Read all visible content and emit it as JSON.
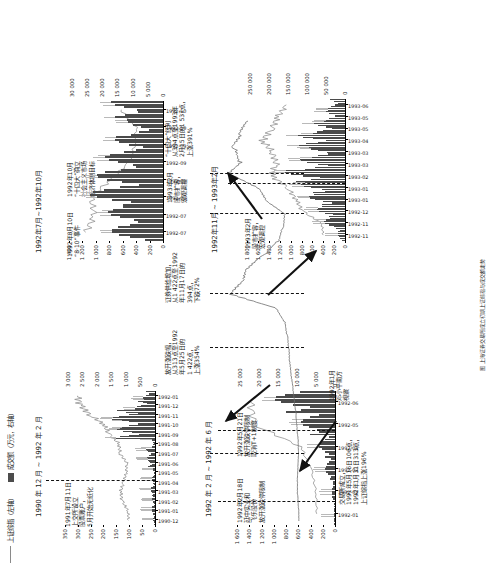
{
  "figure": {
    "caption": "图  上海证券交易所成立初期上证综指与成交额走势",
    "legend": [
      {
        "key": "index",
        "label": "上证综指（左轴）",
        "style": "line",
        "color": "#8a8a8a"
      },
      {
        "key": "volume",
        "label": "成交额（万元，右轴）",
        "style": "bar",
        "color": "#4c4c4c"
      }
    ]
  },
  "panels": [
    {
      "id": "panel-1990-1992",
      "title": "1990 年 12 月 ~ 1992 年 2 月",
      "annotations": [
        {
          "id": "a1",
          "text": "1991年7月11日\n上交所设立\n股票账户，\n5月开始无纸化"
        }
      ],
      "chart_data": {
        "type": "bar",
        "title": "1990 年 12 月 ~ 1992 年 2 月",
        "ylabel": "上证综指（左轴）",
        "y2label": "成交额（万元，右轴）",
        "ylim": [
          0,
          350
        ],
        "yticks": [
          0,
          50,
          100,
          150,
          200,
          250,
          300,
          350
        ],
        "y2lim": [
          0,
          3000
        ],
        "y2ticks": [
          0,
          500,
          1000,
          1500,
          2000,
          2500,
          3000
        ],
        "categories": [
          "1990-12",
          "1991-01",
          "1991-02",
          "1991-03",
          "1991-04",
          "1991-05",
          "1991-06",
          "1991-07",
          "1991-08",
          "1991-09",
          "1991-10",
          "1991-11",
          "1991-12",
          "1992-01"
        ],
        "series": [
          {
            "name": "上证综指",
            "type": "line",
            "values": [
              103,
              105,
              128,
              133,
              121,
              111,
              110,
              136,
              140,
              180,
              198,
              252,
              290,
              300
            ]
          },
          {
            "name": "成交额",
            "type": "bar",
            "values": [
              60,
              120,
              90,
              150,
              110,
              70,
              260,
              300,
              120,
              1350,
              1200,
              1500,
              700,
              420
            ]
          }
        ],
        "grid": false,
        "legend_position": "top"
      }
    },
    {
      "id": "panel-1992-02-06",
      "title": "1992 年 2 月 ~ 1992 年 6 月",
      "annotations": [
        {
          "id": "a2",
          "text": "1992年2月18日\n延中实业和\n飞乐股份\n放开涨跌停限制"
        },
        {
          "id": "a3",
          "text": "1992年5月21日\n放开涨跌停限制\n取消T+1制度"
        }
      ],
      "chart_data": {
        "type": "bar",
        "title": "1992 年 2 月 ~ 1992 年 6 月",
        "ylabel": "上证综指（左轴）",
        "y2label": "成交额（万元，右轴）",
        "ylim": [
          0,
          1600
        ],
        "yticks": [
          0,
          200,
          400,
          600,
          800,
          1000,
          1200,
          1400,
          1600
        ],
        "y2lim": [
          0,
          25000
        ],
        "y2ticks": [
          0,
          5000,
          10000,
          15000,
          20000,
          25000
        ],
        "categories": [
          "1992-01",
          "1992-02",
          "1992-03",
          "1992-04",
          "1992-05",
          "1992-06"
        ],
        "series": [
          {
            "name": "上证综指",
            "type": "line",
            "values": [
              300,
              310,
              390,
              560,
              1320,
              1380
            ]
          },
          {
            "name": "成交额",
            "type": "bar",
            "values": [
              400,
              900,
              2600,
              4200,
              9000,
              16000
            ]
          }
        ],
        "grid": false,
        "legend_position": "top"
      }
    },
    {
      "id": "panel-1992-07-10",
      "title": "1992年7月~1992年10月",
      "annotations": [
        {
          "id": "a4",
          "text": "1992年8月10日\n“8·10”事件"
        },
        {
          "id": "a5",
          "text": "1992年10月\n“十四大”确立\n社会主义市场\n经济体制目标"
        }
      ],
      "chart_data": {
        "type": "bar",
        "title": "1992年7月~1992年10月",
        "ylabel": "上证综指（左轴）",
        "y2label": "成交额（万元，右轴）",
        "ylim": [
          0,
          1400
        ],
        "yticks": [
          0,
          200,
          400,
          600,
          800,
          1000,
          1200,
          1400
        ],
        "y2lim": [
          0,
          30000
        ],
        "y2ticks": [
          0,
          5000,
          10000,
          15000,
          20000,
          25000,
          30000
        ],
        "categories": [
          "1992-07",
          "1992-07",
          "1992-08",
          "1992-08",
          "1992-09",
          "1992-09",
          "1992-10",
          "1992-10"
        ],
        "series": [
          {
            "name": "上证综指",
            "type": "line",
            "values": [
              1150,
              1020,
              1080,
              780,
              500,
              420,
              400,
              620
            ]
          },
          {
            "name": "成交额",
            "type": "bar",
            "values": [
              17000,
              18000,
              24000,
              22000,
              19000,
              16000,
              12000,
              17000
            ]
          }
        ],
        "grid": false,
        "legend_position": "top"
      }
    },
    {
      "id": "panel-1992-11-1993-02",
      "title": "1992年11月 ~ 1993年2月",
      "annotations": [
        {
          "id": "a6",
          "text": "1993年2月\n股市扩容，\n宏观调控"
        }
      ],
      "chart_data": {
        "type": "bar",
        "title": "1992年11月 ~ 1993年2月",
        "ylabel": "上证综指（左轴）",
        "y2label": "成交额（万元，右轴）",
        "ylim": [
          0,
          1800
        ],
        "yticks": [
          0,
          200,
          400,
          600,
          800,
          1000,
          1200,
          1400,
          1600,
          1800
        ],
        "y2lim": [
          0,
          250000
        ],
        "y2ticks": [
          0,
          50000,
          100000,
          150000,
          200000,
          250000
        ],
        "categories": [
          "1992-11",
          "1992-11",
          "1992-12",
          "1993-01",
          "1993-01",
          "1993-02",
          "1993-03",
          "1993-03",
          "1993-04",
          "1993-05",
          "1993-05",
          "1993-06"
        ],
        "series": [
          {
            "name": "上证综指",
            "type": "line",
            "values": [
              400,
              430,
              780,
              900,
              1050,
              1350,
              1270,
              1330,
              1520,
              1350,
              1240,
              1080
            ]
          },
          {
            "name": "成交额",
            "type": "bar",
            "values": [
              20000,
              55000,
              75000,
              95000,
              115000,
              160000,
              120000,
              95000,
              125000,
              85000,
              55000,
              45000
            ]
          }
        ],
        "grid": false,
        "legend_position": "top"
      }
    },
    {
      "id": "panel-overview",
      "title": "",
      "annotations": [
        {
          "id": "o1",
          "text": "交易所成立，\n1991年5月16日106点，\n1992年1月31日313点，\n上证综指上涨196%"
        },
        {
          "id": "o2",
          "text": "1992年1月\n邓小平南方\n视察"
        },
        {
          "id": "o3",
          "text": "放开涨跌幅，\n从313点至1992\n年5月25日的\n1 422点，\n上涨354%"
        },
        {
          "id": "o4",
          "text": "证券供给增加，\n从1 422点至1992\n年11月17日的\n394点，\n下跌72%"
        },
        {
          "id": "o5",
          "text": "1993年2月\n股市扩容，\n宏观调控"
        },
        {
          "id": "o6",
          "text": "“十四大”红利\n从394点至1993年\n2月15日的1 537点，\n上涨391%"
        }
      ],
      "chart_data": {
        "type": "line",
        "title": "",
        "ylabel": "上证综指",
        "ylim": [
          0,
          1600
        ],
        "categories": [
          "1990-12",
          "1991-01",
          "1991-02",
          "1991-03",
          "1991-04",
          "1991-05",
          "1991-06",
          "1991-07",
          "1991-08",
          "1991-09",
          "1991-10",
          "1991-11",
          "1991-12",
          "1992-01",
          "1992-02",
          "1992-03",
          "1992-04",
          "1992-05",
          "1992-06",
          "1992-07",
          "1992-08",
          "1992-09",
          "1992-10",
          "1992-11",
          "1992-12",
          "1993-01",
          "1993-02",
          "1993-03",
          "1993-04",
          "1993-05",
          "1993-06"
        ],
        "series": [
          {
            "name": "上证综指",
            "values": [
              103,
              110,
              128,
              130,
              118,
              106,
              112,
              140,
              160,
              200,
              230,
              270,
              300,
              313,
              340,
              390,
              560,
              1422,
              1180,
              1100,
              780,
              520,
              430,
              394,
              780,
              950,
              1537,
              1280,
              1400,
              1250,
              1120
            ]
          }
        ],
        "key_points": [
          {
            "date": "1991-05-16",
            "value": 106,
            "label": "106点"
          },
          {
            "date": "1992-01-31",
            "value": 313,
            "label": "313点"
          },
          {
            "date": "1992-05-25",
            "value": 1422,
            "label": "1 422点"
          },
          {
            "date": "1992-11-17",
            "value": 394,
            "label": "394点"
          },
          {
            "date": "1993-02-15",
            "value": 1537,
            "label": "1 537点"
          }
        ],
        "grid": false,
        "legend_position": "none"
      }
    }
  ]
}
